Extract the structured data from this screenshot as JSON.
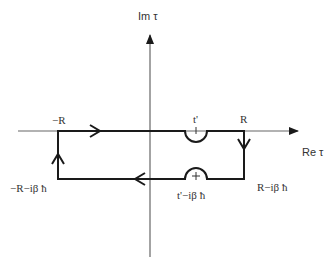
{
  "diagram": {
    "type": "contour-integral",
    "axes": {
      "imaginary_label": "Im τ",
      "real_label": "Re τ"
    },
    "points": {
      "minus_r": "−R",
      "r": "R",
      "t_prime": "t'",
      "minus_r_minus_ibh": "−R−iβ ħ",
      "r_minus_ibh": "R−iβ ħ",
      "t_prime_minus_ibh": "t'−iβ ħ"
    },
    "markers": {
      "top_pole": "ı",
      "bottom_pole": "+"
    },
    "colors": {
      "axis": "#666666",
      "contour": "#1a1a1a",
      "text": "#333333",
      "background": "#ffffff"
    }
  }
}
